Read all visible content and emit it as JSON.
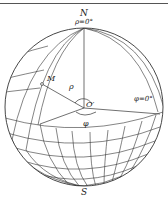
{
  "figure": {
    "type": "spherical-coordinate-diagram",
    "labels": {
      "north_pole": "N",
      "rho_zero": "ρ=0°",
      "point_m": "M",
      "rho": "ρ",
      "center": "O′",
      "phi_zero": "φ=0°",
      "phi": "φ",
      "south_pole": "S"
    },
    "colors": {
      "line": "#333333",
      "background": "#ffffff"
    }
  }
}
